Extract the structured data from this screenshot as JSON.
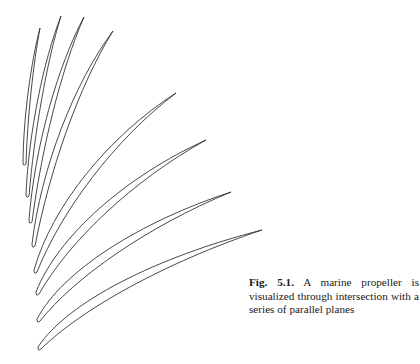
{
  "figure": {
    "label": "Fig. 5.1.",
    "caption_text": "A marine propeller is visualized through intersection with a series of parallel planes",
    "stroke_color": "#333333",
    "blades": [
      {
        "tip": [
          40,
          28
        ],
        "end": [
          24,
          165
        ],
        "width": 3
      },
      {
        "tip": [
          61,
          16
        ],
        "end": [
          27,
          197
        ],
        "width": 4
      },
      {
        "tip": [
          84,
          17
        ],
        "end": [
          30,
          223
        ],
        "width": 5
      },
      {
        "tip": [
          113,
          31
        ],
        "end": [
          33,
          247
        ],
        "width": 6
      },
      {
        "tip": [
          176,
          93
        ],
        "end": [
          35,
          273
        ],
        "width": 7
      },
      {
        "tip": [
          206,
          140
        ],
        "end": [
          37,
          295
        ],
        "width": 8
      },
      {
        "tip": [
          231,
          192
        ],
        "end": [
          38,
          322
        ],
        "width": 9
      },
      {
        "tip": [
          262,
          230
        ],
        "end": [
          39,
          350
        ],
        "width": 10
      }
    ]
  }
}
